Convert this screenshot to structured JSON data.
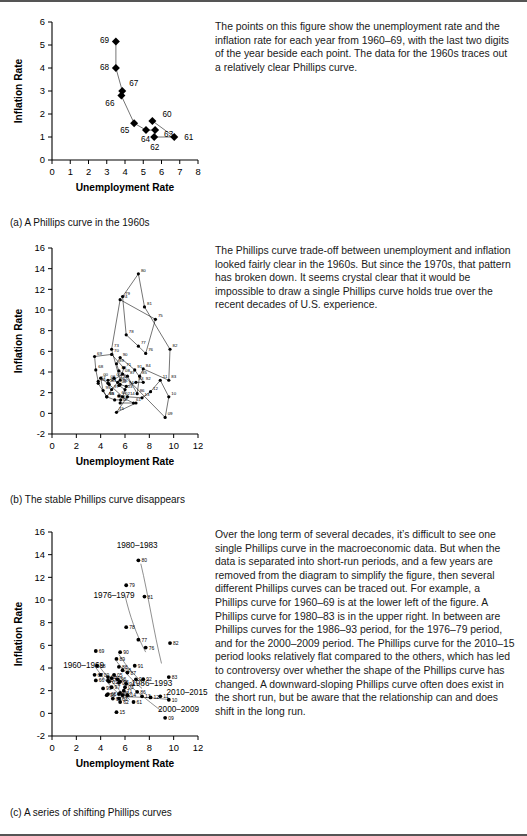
{
  "figure": {
    "panels": [
      {
        "id": "a",
        "caption": "(a)  A Phillips curve in the 1960s",
        "prose": "The points on this figure show the unemployment rate and the inflation rate for each year from 1960–69, with the last two digits of the year beside each point. The data for the 1960s traces out a relatively clear Phillips curve."
      },
      {
        "id": "b",
        "caption": "(b)  The stable Phillips curve disappears",
        "prose": "The Phillips curve trade-off between unemployment and inflation looked fairly clear in the 1960s. But since the 1970s, that pattern has broken down. It seems crystal clear that it would be impossible to draw a single Phillips curve holds true over the recent decades of U.S. experience."
      },
      {
        "id": "c",
        "caption": "(c)  A series of shifting Phillips curves",
        "prose": "Over the long term of several decades, it’s difficult to see one single Phillips curve in the macroeconomic data. But when the data is separated into short-run periods, and a few years are removed from the diagram to simplify the figure, then several different Phillips curves can be traced out. For example, a Phillips curve for 1960–69 is at the lower left of the figure. A Phillips curve for 1980–83 is in the upper right. In between are Phillips curves for the 1986–93 period, for the 1976–79 period, and for the 2000–2009 period. The Phillips curve for the 2010–15 period looks relatively flat compared to the others, which has led to controversy over whether the shape of the Phillips curve has changed. A downward-sloping Phillips curve often does exist in the short run, but be aware that the relationship can and does shift in the long run."
      }
    ]
  },
  "chart_data": [
    {
      "id": "a",
      "type": "scatter",
      "title": "",
      "xlabel": "Unemployment Rate",
      "ylabel": "Inflation Rate",
      "xlim": [
        0,
        8
      ],
      "ylim": [
        0,
        6
      ],
      "xticks": [
        "0",
        "1",
        "2",
        "3",
        "4",
        "5",
        "6",
        "7",
        "8"
      ],
      "yticks": [
        "0",
        "1",
        "2",
        "3",
        "4",
        "5",
        "6"
      ],
      "grid": false,
      "legend": "none",
      "marker": "filled-diamond",
      "connected": true,
      "points": [
        {
          "label": "60",
          "x": 5.5,
          "y": 1.7,
          "lx": 10,
          "ly": -4
        },
        {
          "label": "61",
          "x": 6.7,
          "y": 1.0,
          "lx": 10,
          "ly": 3
        },
        {
          "label": "62",
          "x": 5.6,
          "y": 1.0,
          "lx": -4,
          "ly": 13
        },
        {
          "label": "63",
          "x": 5.65,
          "y": 1.3,
          "lx": 9,
          "ly": 7
        },
        {
          "label": "64",
          "x": 5.15,
          "y": 1.3,
          "lx": -5,
          "ly": 12
        },
        {
          "label": "65",
          "x": 4.5,
          "y": 1.6,
          "lx": -14,
          "ly": 10
        },
        {
          "label": "66",
          "x": 3.8,
          "y": 2.8,
          "lx": -16,
          "ly": 10
        },
        {
          "label": "67",
          "x": 3.85,
          "y": 3.0,
          "lx": 7,
          "ly": -5
        },
        {
          "label": "68",
          "x": 3.5,
          "y": 4.0,
          "lx": -16,
          "ly": 2
        },
        {
          "label": "69",
          "x": 3.5,
          "y": 5.15,
          "lx": -16,
          "ly": 1
        }
      ],
      "path_order": [
        "60",
        "61",
        "62",
        "63",
        "64",
        "65",
        "66",
        "67",
        "68",
        "69"
      ]
    },
    {
      "id": "b",
      "type": "scatter",
      "title": "",
      "xlabel": "Unemployment Rate",
      "ylabel": "Inflation Rate",
      "xlim": [
        0,
        12
      ],
      "ylim": [
        -2,
        16
      ],
      "xticks": [
        "0",
        "2",
        "4",
        "6",
        "8",
        "10",
        "12"
      ],
      "yticks": [
        "-2",
        "0",
        "2",
        "4",
        "6",
        "8",
        "10",
        "12",
        "14",
        "16"
      ],
      "grid": false,
      "legend": "none",
      "marker": "filled-circle",
      "connected": true,
      "points": [
        {
          "label": "60",
          "x": 5.5,
          "y": 1.7
        },
        {
          "label": "61",
          "x": 6.7,
          "y": 1.0
        },
        {
          "label": "62",
          "x": 5.6,
          "y": 1.0
        },
        {
          "label": "63",
          "x": 5.65,
          "y": 1.3
        },
        {
          "label": "64",
          "x": 5.15,
          "y": 1.3
        },
        {
          "label": "65",
          "x": 4.5,
          "y": 1.6
        },
        {
          "label": "66",
          "x": 3.8,
          "y": 2.9
        },
        {
          "label": "67",
          "x": 3.8,
          "y": 3.1
        },
        {
          "label": "68",
          "x": 3.6,
          "y": 4.2
        },
        {
          "label": "69",
          "x": 3.5,
          "y": 5.5
        },
        {
          "label": "70",
          "x": 4.9,
          "y": 5.7
        },
        {
          "label": "71",
          "x": 5.9,
          "y": 4.4
        },
        {
          "label": "72",
          "x": 5.6,
          "y": 3.2
        },
        {
          "label": "73",
          "x": 4.9,
          "y": 6.2
        },
        {
          "label": "74",
          "x": 5.6,
          "y": 11.0
        },
        {
          "label": "75",
          "x": 8.5,
          "y": 9.1
        },
        {
          "label": "76",
          "x": 7.7,
          "y": 5.8
        },
        {
          "label": "77",
          "x": 7.1,
          "y": 6.5
        },
        {
          "label": "78",
          "x": 6.1,
          "y": 7.6
        },
        {
          "label": "79",
          "x": 5.8,
          "y": 11.3
        },
        {
          "label": "80",
          "x": 7.1,
          "y": 13.5
        },
        {
          "label": "81",
          "x": 7.6,
          "y": 10.3
        },
        {
          "label": "82",
          "x": 9.7,
          "y": 6.2
        },
        {
          "label": "83",
          "x": 9.6,
          "y": 3.2
        },
        {
          "label": "84",
          "x": 7.5,
          "y": 4.3
        },
        {
          "label": "85",
          "x": 7.2,
          "y": 3.6
        },
        {
          "label": "86",
          "x": 7.0,
          "y": 1.9
        },
        {
          "label": "87",
          "x": 6.2,
          "y": 3.6
        },
        {
          "label": "88",
          "x": 5.5,
          "y": 4.1
        },
        {
          "label": "89",
          "x": 5.3,
          "y": 4.8
        },
        {
          "label": "90",
          "x": 5.6,
          "y": 5.4
        },
        {
          "label": "91",
          "x": 6.8,
          "y": 4.2
        },
        {
          "label": "92",
          "x": 7.5,
          "y": 3.0
        },
        {
          "label": "93",
          "x": 6.9,
          "y": 3.0
        },
        {
          "label": "94",
          "x": 6.1,
          "y": 2.6
        },
        {
          "label": "95",
          "x": 5.6,
          "y": 2.8
        },
        {
          "label": "96",
          "x": 5.4,
          "y": 3.0
        },
        {
          "label": "97",
          "x": 4.9,
          "y": 2.3
        },
        {
          "label": "98",
          "x": 4.5,
          "y": 1.6
        },
        {
          "label": "99",
          "x": 4.2,
          "y": 2.2
        },
        {
          "label": "00",
          "x": 4.0,
          "y": 3.4
        },
        {
          "label": "01",
          "x": 4.7,
          "y": 2.8
        },
        {
          "label": "02",
          "x": 5.8,
          "y": 1.6
        },
        {
          "label": "03",
          "x": 6.0,
          "y": 2.3
        },
        {
          "label": "04",
          "x": 5.5,
          "y": 2.7
        },
        {
          "label": "05",
          "x": 5.1,
          "y": 3.4
        },
        {
          "label": "06",
          "x": 4.6,
          "y": 3.2
        },
        {
          "label": "07",
          "x": 4.6,
          "y": 2.9
        },
        {
          "label": "08",
          "x": 5.8,
          "y": 3.8
        },
        {
          "label": "09",
          "x": 9.3,
          "y": -0.4
        },
        {
          "label": "10",
          "x": 9.6,
          "y": 1.6
        },
        {
          "label": "11",
          "x": 8.9,
          "y": 3.2
        },
        {
          "label": "12",
          "x": 8.1,
          "y": 2.1
        },
        {
          "label": "13",
          "x": 7.4,
          "y": 1.5
        },
        {
          "label": "14",
          "x": 6.2,
          "y": 1.6
        },
        {
          "label": "15",
          "x": 5.3,
          "y": 0.1
        },
        {
          "label": "61b",
          "x": 6.9,
          "y": 1.0
        }
      ]
    },
    {
      "id": "c",
      "type": "scatter",
      "title": "",
      "xlabel": "Unemployment Rate",
      "ylabel": "Inflation Rate",
      "xlim": [
        0,
        12
      ],
      "ylim": [
        -2,
        16
      ],
      "xticks": [
        "0",
        "2",
        "4",
        "6",
        "8",
        "10",
        "12"
      ],
      "yticks": [
        "-2",
        "0",
        "2",
        "4",
        "6",
        "8",
        "10",
        "12",
        "14",
        "16"
      ],
      "grid": false,
      "legend": "none",
      "marker": "filled-circle",
      "connected": false,
      "era_labels": [
        {
          "text": "1980–1983",
          "x": 7.0,
          "y": 14.6
        },
        {
          "text": "1976–1979",
          "x": 5.1,
          "y": 10.2
        },
        {
          "text": "1960–1969",
          "x": 2.6,
          "y": 4.0
        },
        {
          "text": "1986–1993",
          "x": 8.2,
          "y": 2.4
        },
        {
          "text": "2010–2015",
          "x": 11.1,
          "y": 1.6
        },
        {
          "text": "2000–2009",
          "x": 10.4,
          "y": 0.1
        }
      ],
      "points": [
        {
          "label": "80",
          "x": 7.1,
          "y": 13.5
        },
        {
          "label": "81",
          "x": 7.6,
          "y": 10.3
        },
        {
          "label": "82",
          "x": 9.7,
          "y": 6.2
        },
        {
          "label": "83",
          "x": 9.6,
          "y": 3.2
        },
        {
          "label": "79",
          "x": 6.1,
          "y": 11.3
        },
        {
          "label": "78",
          "x": 6.1,
          "y": 7.6
        },
        {
          "label": "77",
          "x": 7.1,
          "y": 6.5
        },
        {
          "label": "76",
          "x": 7.7,
          "y": 5.8
        },
        {
          "label": "69",
          "x": 3.6,
          "y": 5.5
        },
        {
          "label": "68",
          "x": 3.7,
          "y": 4.2
        },
        {
          "label": "67",
          "x": 3.5,
          "y": 3.4
        },
        {
          "label": "66",
          "x": 3.6,
          "y": 2.9
        },
        {
          "label": "65",
          "x": 4.6,
          "y": 1.7
        },
        {
          "label": "64",
          "x": 5.0,
          "y": 1.3
        },
        {
          "label": "63",
          "x": 5.5,
          "y": 1.3
        },
        {
          "label": "62",
          "x": 5.6,
          "y": 1.0
        },
        {
          "label": "61",
          "x": 6.7,
          "y": 1.0
        },
        {
          "label": "60",
          "x": 5.5,
          "y": 1.7
        },
        {
          "label": "90",
          "x": 5.6,
          "y": 5.4
        },
        {
          "label": "89",
          "x": 5.3,
          "y": 4.8
        },
        {
          "label": "88",
          "x": 5.5,
          "y": 4.1
        },
        {
          "label": "87",
          "x": 6.2,
          "y": 3.6
        },
        {
          "label": "91",
          "x": 6.8,
          "y": 4.2
        },
        {
          "label": "86",
          "x": 7.0,
          "y": 1.9
        },
        {
          "label": "93",
          "x": 6.9,
          "y": 3.0
        },
        {
          "label": "92",
          "x": 7.5,
          "y": 3.0
        },
        {
          "label": "70",
          "x": 4.9,
          "y": 3.1
        },
        {
          "label": "71",
          "x": 5.9,
          "y": 2.0
        },
        {
          "label": "72",
          "x": 5.6,
          "y": 1.8
        },
        {
          "label": "05",
          "x": 5.1,
          "y": 3.4
        },
        {
          "label": "04",
          "x": 5.5,
          "y": 2.7
        },
        {
          "label": "03",
          "x": 6.0,
          "y": 2.3
        },
        {
          "label": "02",
          "x": 5.8,
          "y": 1.6
        },
        {
          "label": "01",
          "x": 4.7,
          "y": 2.8
        },
        {
          "label": "00",
          "x": 4.0,
          "y": 3.4
        },
        {
          "label": "06",
          "x": 4.6,
          "y": 3.2
        },
        {
          "label": "07",
          "x": 4.6,
          "y": 2.9
        },
        {
          "label": "08",
          "x": 5.8,
          "y": 3.8
        },
        {
          "label": "09",
          "x": 9.3,
          "y": -0.4
        },
        {
          "label": "10",
          "x": 9.6,
          "y": 1.2
        },
        {
          "label": "11",
          "x": 8.9,
          "y": 1.5
        },
        {
          "label": "12",
          "x": 8.1,
          "y": 1.4
        },
        {
          "label": "13",
          "x": 7.4,
          "y": 1.5
        },
        {
          "label": "14",
          "x": 6.2,
          "y": 1.6
        },
        {
          "label": "15",
          "x": 5.3,
          "y": 0.1
        },
        {
          "label": "98",
          "x": 4.5,
          "y": 1.6
        },
        {
          "label": "99",
          "x": 4.2,
          "y": 2.2
        },
        {
          "label": "94",
          "x": 6.1,
          "y": 2.6
        },
        {
          "label": "95",
          "x": 5.6,
          "y": 2.8
        },
        {
          "label": "96",
          "x": 5.4,
          "y": 3.0
        },
        {
          "label": "97",
          "x": 4.9,
          "y": 2.3
        }
      ]
    }
  ]
}
